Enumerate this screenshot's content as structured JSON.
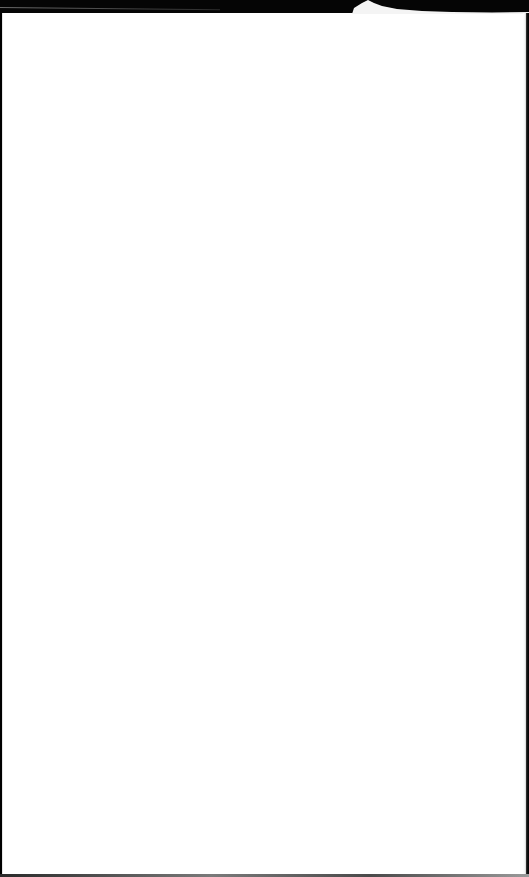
{
  "page": {
    "type": "blank-sheet",
    "colors": {
      "paper": "#ffffff",
      "background": "#000000"
    }
  }
}
